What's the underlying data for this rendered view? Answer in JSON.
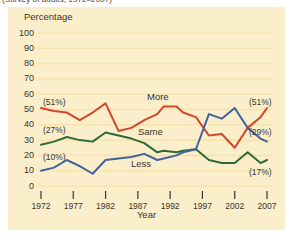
{
  "caption": {
    "text": "(Survey of adults, 1972–2007)"
  },
  "axes": {
    "ylabel": "Percentage",
    "xlabel": "Year",
    "yticks": [
      "0",
      "10",
      "20",
      "30",
      "40",
      "50",
      "60",
      "70",
      "80",
      "90",
      "100"
    ],
    "xticks": [
      "1972",
      "1977",
      "1982",
      "1987",
      "1992",
      "1997",
      "2002",
      "2007"
    ]
  },
  "series_labels": {
    "more": "More",
    "same": "Same",
    "less": "Less"
  },
  "annotations": {
    "left_more": "(51%)",
    "left_same": "(27%)",
    "left_less": "(10%)",
    "right_more": "(51%)",
    "right_blue": "(29%)",
    "right_green": "(17%)"
  },
  "colors": {
    "more": "#d0472a",
    "same": "#2e6b35",
    "less": "#42619e",
    "panel": "#fbeecb",
    "grid": "#f7e3ae",
    "text": "#3a352c"
  },
  "chart_data": {
    "type": "line",
    "title": "",
    "subtitle": "(Survey of adults, 1972–2007)",
    "xlabel": "Year",
    "ylabel": "Percentage",
    "ylim": [
      0,
      100
    ],
    "xlim": [
      1972,
      2007
    ],
    "grid": true,
    "legend": "inline-labels",
    "yticks": [
      0,
      10,
      20,
      30,
      40,
      50,
      60,
      70,
      80,
      90,
      100
    ],
    "xticks": [
      1972,
      1977,
      1982,
      1987,
      1992,
      1997,
      2002,
      2007
    ],
    "x": [
      1972,
      1974,
      1976,
      1978,
      1980,
      1982,
      1984,
      1986,
      1988,
      1990,
      1991,
      1993,
      1994,
      1996,
      1998,
      2000,
      2002,
      2004,
      2006,
      2007
    ],
    "series": [
      {
        "name": "More",
        "color": "#d0472a",
        "start_label": "(51%)",
        "end_label": "(51%)",
        "values": [
          51,
          49,
          48,
          43,
          48,
          54,
          36,
          38,
          43,
          47,
          52,
          52,
          48,
          45,
          33,
          34,
          25,
          38,
          45,
          51
        ]
      },
      {
        "name": "Same",
        "color": "#2e6b35",
        "start_label": "(27%)",
        "end_label": "(17%)",
        "values": [
          27,
          29,
          32,
          30,
          29,
          35,
          33,
          31,
          28,
          22,
          23,
          22,
          23,
          24,
          17,
          15,
          15,
          22,
          15,
          17
        ]
      },
      {
        "name": "Less",
        "color": "#42619e",
        "start_label": "(10%)",
        "end_label": "(29%)",
        "values": [
          10,
          12,
          17,
          13,
          8,
          17,
          18,
          19,
          21,
          17,
          18,
          20,
          22,
          24,
          47,
          44,
          51,
          38,
          31,
          29
        ]
      }
    ]
  }
}
